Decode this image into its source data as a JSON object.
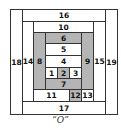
{
  "diagram": {
    "caption": "“O”",
    "colors": {
      "light": "#ffffff",
      "dark": "#b5b5b5",
      "outline": "#333333"
    },
    "pieces": [
      {
        "id": "1",
        "label": "1",
        "shade": "light"
      },
      {
        "id": "2",
        "label": "2",
        "shade": "dark"
      },
      {
        "id": "3",
        "label": "3",
        "shade": "light"
      },
      {
        "id": "4",
        "label": "4",
        "shade": "light"
      },
      {
        "id": "5",
        "label": "5",
        "shade": "light"
      },
      {
        "id": "6",
        "label": "6",
        "shade": "dark"
      },
      {
        "id": "7",
        "label": "7",
        "shade": "dark"
      },
      {
        "id": "8",
        "label": "8",
        "shade": "dark"
      },
      {
        "id": "9",
        "label": "9",
        "shade": "dark"
      },
      {
        "id": "10",
        "label": "10",
        "shade": "light"
      },
      {
        "id": "11",
        "label": "11",
        "shade": "light"
      },
      {
        "id": "12",
        "label": "12",
        "shade": "dark"
      },
      {
        "id": "13",
        "label": "13",
        "shade": "light"
      },
      {
        "id": "14",
        "label": "14",
        "shade": "light"
      },
      {
        "id": "15",
        "label": "15",
        "shade": "light"
      },
      {
        "id": "16",
        "label": "16",
        "shade": "light"
      },
      {
        "id": "17",
        "label": "17",
        "shade": "light"
      },
      {
        "id": "18",
        "label": "18",
        "shade": "light"
      },
      {
        "id": "19",
        "label": "19",
        "shade": "light"
      }
    ]
  }
}
